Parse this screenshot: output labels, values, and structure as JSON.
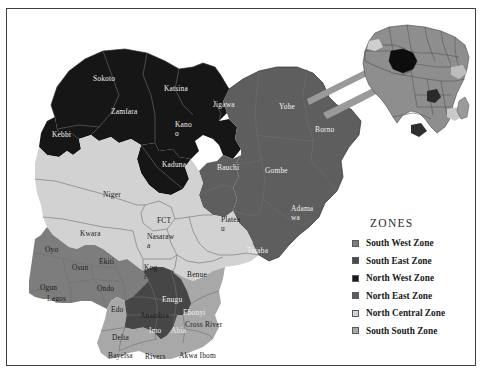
{
  "figure": {
    "type": "choropleth-map",
    "background_color": "#ffffff",
    "frame_color": "#3d3d3d"
  },
  "legend": {
    "title": "ZONES",
    "items": [
      {
        "label": "South West Zone",
        "color": "#7d7d7d"
      },
      {
        "label": "South East Zone",
        "color": "#4a4a4a"
      },
      {
        "label": "North West Zone",
        "color": "#1a1a1a"
      },
      {
        "label": "North East Zone",
        "color": "#5e5e5e"
      },
      {
        "label": "North Central Zone",
        "color": "#d2d2d2"
      },
      {
        "label": "South South Zone",
        "color": "#a8a8a8"
      }
    ]
  },
  "inset": {
    "name": "africa-inset",
    "highlight_country": "Nigeria",
    "highlight_color": "#0d0d0d"
  },
  "map_labels": [
    {
      "name": "Sokoto",
      "text": "Sokoto",
      "x": 86,
      "y": 66,
      "tone": "wh"
    },
    {
      "name": "Zamfara",
      "text": "Zamfara",
      "x": 104,
      "y": 99,
      "tone": "wh"
    },
    {
      "name": "Katsina",
      "text": "Katsina",
      "x": 157,
      "y": 76,
      "tone": "wh"
    },
    {
      "name": "Kebbi",
      "text": "Kebbi",
      "x": 45,
      "y": 122,
      "tone": "wh"
    },
    {
      "name": "Kano",
      "text": "Kano\no",
      "x": 168,
      "y": 112,
      "tone": "wh"
    },
    {
      "name": "Jigawa",
      "text": "Jigawa",
      "x": 206,
      "y": 92,
      "tone": "wh"
    },
    {
      "name": "Kaduna",
      "text": "Kaduna",
      "x": 155,
      "y": 152,
      "tone": "wh"
    },
    {
      "name": "Yobe",
      "text": "Yobe",
      "x": 272,
      "y": 94,
      "tone": "wh"
    },
    {
      "name": "Borno",
      "text": "Borno",
      "x": 308,
      "y": 117,
      "tone": "wh"
    },
    {
      "name": "Bauchi",
      "text": "Bauchi",
      "x": 210,
      "y": 155,
      "tone": "wh"
    },
    {
      "name": "Gombe",
      "text": "Gombe",
      "x": 258,
      "y": 158,
      "tone": "wh"
    },
    {
      "name": "Adamawa",
      "text": "Adama\nwa",
      "x": 284,
      "y": 196,
      "tone": "wh"
    },
    {
      "name": "Taraba",
      "text": "Taraba",
      "x": 240,
      "y": 238,
      "tone": "wh"
    },
    {
      "name": "Niger",
      "text": "Niger",
      "x": 96,
      "y": 182,
      "tone": "dk"
    },
    {
      "name": "FCT",
      "text": "FCT",
      "x": 150,
      "y": 208,
      "tone": "dk"
    },
    {
      "name": "Plateau",
      "text": "Platea\nu",
      "x": 214,
      "y": 207,
      "tone": "dk"
    },
    {
      "name": "Nasarawa",
      "text": "Nasaraw\na",
      "x": 140,
      "y": 224,
      "tone": "dk"
    },
    {
      "name": "Kwara",
      "text": "Kwara",
      "x": 73,
      "y": 221,
      "tone": "dk"
    },
    {
      "name": "Kogi",
      "text": "Kog\ni",
      "x": 137,
      "y": 255,
      "tone": "dk"
    },
    {
      "name": "Benue",
      "text": "Benue",
      "x": 180,
      "y": 262,
      "tone": "dk"
    },
    {
      "name": "Oyo",
      "text": "Oyo",
      "x": 38,
      "y": 237,
      "tone": "dk"
    },
    {
      "name": "Osun",
      "text": "Osun",
      "x": 65,
      "y": 255,
      "tone": "dk"
    },
    {
      "name": "Ekiti",
      "text": "Ekiti",
      "x": 92,
      "y": 249,
      "tone": "dk"
    },
    {
      "name": "Ogun",
      "text": "Ogun",
      "x": 33,
      "y": 275,
      "tone": "dk"
    },
    {
      "name": "Lagos",
      "text": "Lagos",
      "x": 40,
      "y": 286,
      "tone": "dk"
    },
    {
      "name": "Ondo",
      "text": "Ondo",
      "x": 90,
      "y": 276,
      "tone": "dk"
    },
    {
      "name": "Edo",
      "text": "Edo",
      "x": 104,
      "y": 297,
      "tone": "dk"
    },
    {
      "name": "Anambra",
      "text": "Anambra",
      "x": 133,
      "y": 303,
      "tone": "dk"
    },
    {
      "name": "Enugu",
      "text": "Enugu",
      "x": 155,
      "y": 287,
      "tone": "wh"
    },
    {
      "name": "Ebonyi",
      "text": "Ebonyi",
      "x": 176,
      "y": 300,
      "tone": "wh"
    },
    {
      "name": "Imo",
      "text": "Imo",
      "x": 142,
      "y": 318,
      "tone": "wh"
    },
    {
      "name": "Abia",
      "text": "Abia",
      "x": 164,
      "y": 318,
      "tone": "wh"
    },
    {
      "name": "CrossRiver",
      "text": "Cross River",
      "x": 178,
      "y": 312,
      "tone": "dk"
    },
    {
      "name": "Delta",
      "text": "Delta",
      "x": 105,
      "y": 325,
      "tone": "dk"
    },
    {
      "name": "Bayelsa",
      "text": "Bayelsa",
      "x": 101,
      "y": 343,
      "tone": "dk"
    },
    {
      "name": "Rivers",
      "text": "Rivers",
      "x": 138,
      "y": 344,
      "tone": "dk"
    },
    {
      "name": "AkwaIbom",
      "text": "Akwa Ibom",
      "x": 172,
      "y": 343,
      "tone": "dk"
    }
  ]
}
